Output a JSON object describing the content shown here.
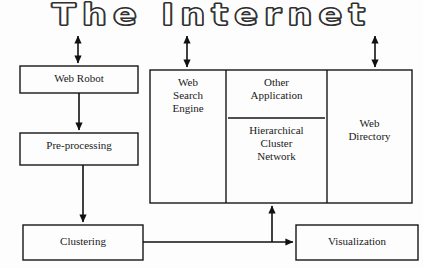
{
  "diagram": {
    "title": "The Internet",
    "type": "flow-diagram",
    "background_color": "#fdfdfd",
    "line_color": "#000000",
    "nodes": [
      {
        "id": "web-robot",
        "label": "Web Robot",
        "x": 20,
        "y": 66,
        "w": 118,
        "h": 27
      },
      {
        "id": "pre-processing",
        "label": "Pre-processing",
        "x": 20,
        "y": 133,
        "w": 118,
        "h": 32
      },
      {
        "id": "clustering",
        "label": "Clustering",
        "x": 23,
        "y": 225,
        "w": 120,
        "h": 35
      },
      {
        "id": "visualization",
        "label": "Visualization",
        "x": 296,
        "y": 225,
        "w": 122,
        "h": 35
      },
      {
        "id": "web-search-engine",
        "label": "Web\nSearch\nEngine",
        "x": 150,
        "y": 70,
        "w": 76,
        "h": 133
      },
      {
        "id": "other-application",
        "label": "Other\nApplication",
        "x": 226,
        "y": 70,
        "w": 101,
        "h": 48
      },
      {
        "id": "hierarchical-cluster-network",
        "label": "Hierarchical\nCluster\nNetwork",
        "x": 226,
        "y": 118,
        "w": 101,
        "h": 85
      },
      {
        "id": "web-directory",
        "label": "Web\nDirectory",
        "x": 327,
        "y": 70,
        "w": 85,
        "h": 133
      }
    ],
    "group": {
      "id": "internet-services-group",
      "x": 150,
      "y": 70,
      "w": 262,
      "h": 133,
      "dividers_x": [
        226,
        327
      ],
      "divider_y": 118
    },
    "connectors": [
      {
        "id": "internet-to-web-robot",
        "kind": "double-arrow-vertical",
        "x": 78,
        "y1": 33,
        "y2": 66
      },
      {
        "id": "internet-to-web-search-engine",
        "kind": "double-arrow-vertical",
        "x": 187,
        "y1": 33,
        "y2": 70
      },
      {
        "id": "internet-to-web-directory",
        "kind": "double-arrow-vertical",
        "x": 375,
        "y1": 33,
        "y2": 70
      },
      {
        "id": "web-robot-to-pre-processing",
        "kind": "arrow-down",
        "x": 79,
        "y1": 93,
        "y2": 133
      },
      {
        "id": "pre-processing-to-clustering",
        "kind": "arrow-down",
        "x": 83,
        "y1": 165,
        "y2": 225
      },
      {
        "id": "clustering-to-visualization",
        "kind": "arrow-right",
        "y": 242,
        "x1": 143,
        "x2": 296
      },
      {
        "id": "clustering-to-cluster-network",
        "kind": "arrow-up",
        "x": 272,
        "y1": 242,
        "y2": 203
      }
    ]
  }
}
